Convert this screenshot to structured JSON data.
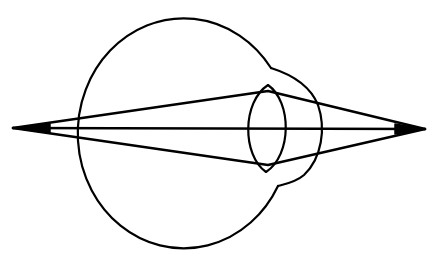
{
  "diagram": {
    "title": "",
    "colors": {
      "line": "#000000",
      "background": "#ffffff"
    },
    "elements": [
      {
        "name": "eyeball",
        "shape": "circle-arc"
      },
      {
        "name": "cornea",
        "shape": "arc"
      },
      {
        "name": "lens",
        "shape": "biconvex"
      },
      {
        "name": "ray-top",
        "shape": "line"
      },
      {
        "name": "ray-axis",
        "shape": "line"
      },
      {
        "name": "ray-bottom",
        "shape": "line"
      }
    ],
    "points": {
      "left_focus": [
        13,
        128
      ],
      "right_focus": [
        425,
        129
      ]
    }
  }
}
